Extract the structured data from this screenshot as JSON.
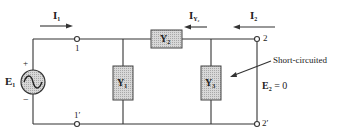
{
  "diagram": {
    "type": "two-port admittance network (pi network) with output short-circuited",
    "source": {
      "label": "E",
      "sub": "1",
      "plus": "+",
      "minus": "−",
      "symbol": "ac-voltage-source"
    },
    "currents": [
      {
        "label": "I",
        "sub": "1",
        "direction": "right"
      },
      {
        "label": "I",
        "sub": "Y₂",
        "direction": "left"
      },
      {
        "label": "I",
        "sub": "2",
        "direction": "left"
      }
    ],
    "elements": [
      {
        "id": "Y1",
        "label": "Y",
        "sub": "1"
      },
      {
        "id": "Y2",
        "label": "Y",
        "sub": "2"
      },
      {
        "id": "Y3",
        "label": "Y",
        "sub": "3"
      }
    ],
    "terminals": {
      "t1": "1",
      "t1p": "1′",
      "t2": "2",
      "t2p": "2′"
    },
    "annotation": "Short-circuited",
    "output_voltage": {
      "label": "E",
      "sub": "2",
      "eq": "= 0"
    },
    "colors": {
      "line": "#333333",
      "box_fill": "#cfcfcf",
      "box_border": "#444444"
    }
  }
}
